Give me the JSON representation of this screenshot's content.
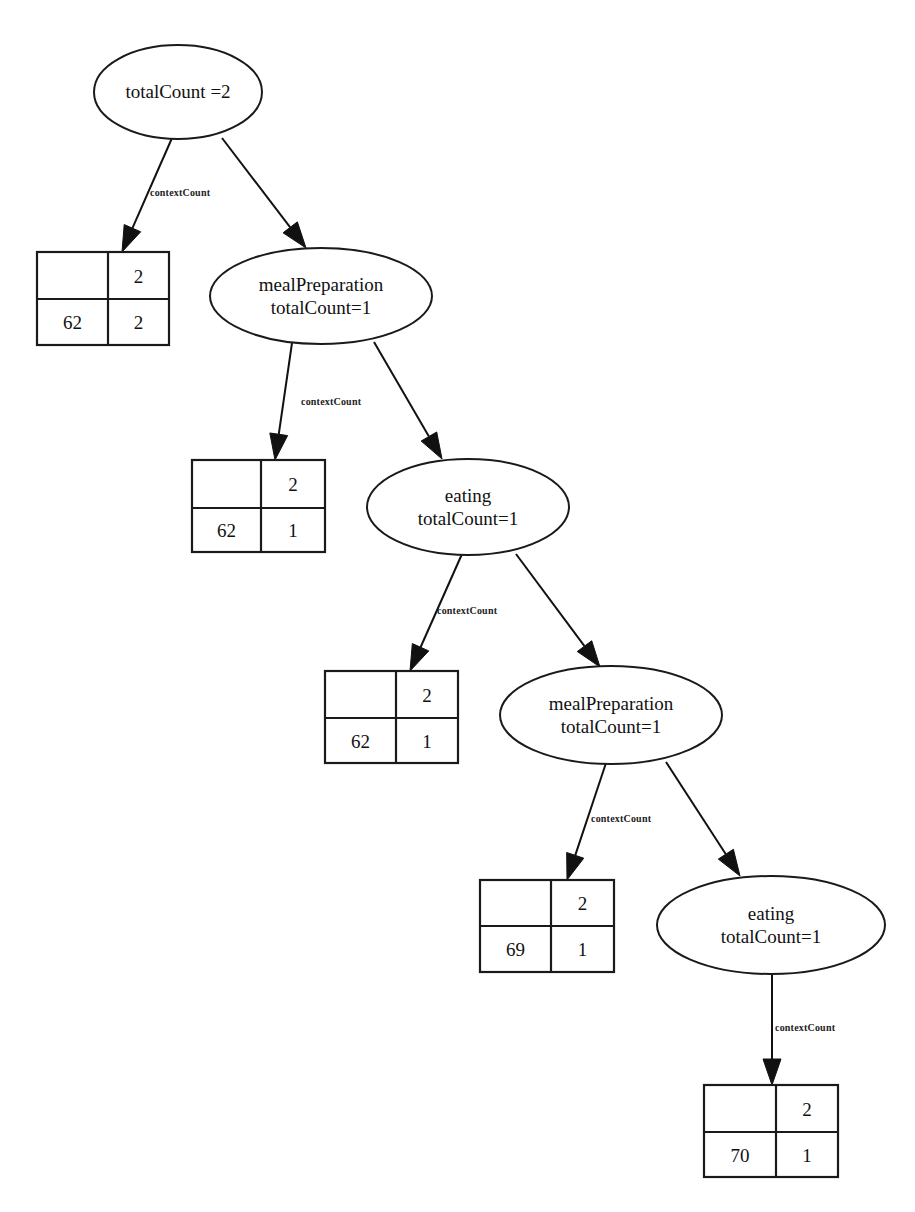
{
  "diagram": {
    "type": "tree",
    "background_color": "#ffffff",
    "stroke_color": "#1a1a1a",
    "nodes": [
      {
        "id": "n0",
        "kind": "ellipse",
        "lines": [
          "totalCount =2"
        ]
      },
      {
        "id": "t0",
        "kind": "table",
        "cells": [
          [
            "",
            "2"
          ],
          [
            "62",
            "2"
          ]
        ]
      },
      {
        "id": "n1",
        "kind": "ellipse",
        "lines": [
          "mealPreparation",
          "totalCount=1"
        ]
      },
      {
        "id": "t1",
        "kind": "table",
        "cells": [
          [
            "",
            "2"
          ],
          [
            "62",
            "1"
          ]
        ]
      },
      {
        "id": "n2",
        "kind": "ellipse",
        "lines": [
          "eating",
          "totalCount=1"
        ]
      },
      {
        "id": "t2",
        "kind": "table",
        "cells": [
          [
            "",
            "2"
          ],
          [
            "62",
            "1"
          ]
        ]
      },
      {
        "id": "n3",
        "kind": "ellipse",
        "lines": [
          "mealPreparation",
          "totalCount=1"
        ]
      },
      {
        "id": "t3",
        "kind": "table",
        "cells": [
          [
            "",
            "2"
          ],
          [
            "69",
            "1"
          ]
        ]
      },
      {
        "id": "n4",
        "kind": "ellipse",
        "lines": [
          "eating",
          "totalCount=1"
        ]
      },
      {
        "id": "t4",
        "kind": "table",
        "cells": [
          [
            "",
            "2"
          ],
          [
            "70",
            "1"
          ]
        ]
      }
    ],
    "edges": [
      {
        "from": "n0",
        "to": "t0",
        "label": "contextCount"
      },
      {
        "from": "n0",
        "to": "n1",
        "label": ""
      },
      {
        "from": "n1",
        "to": "t1",
        "label": "contextCount"
      },
      {
        "from": "n1",
        "to": "n2",
        "label": ""
      },
      {
        "from": "n2",
        "to": "t2",
        "label": "contextCount"
      },
      {
        "from": "n2",
        "to": "n3",
        "label": ""
      },
      {
        "from": "n3",
        "to": "t3",
        "label": "contextCount"
      },
      {
        "from": "n3",
        "to": "n4",
        "label": ""
      },
      {
        "from": "n4",
        "to": "t4",
        "label": "contextCount"
      }
    ]
  }
}
